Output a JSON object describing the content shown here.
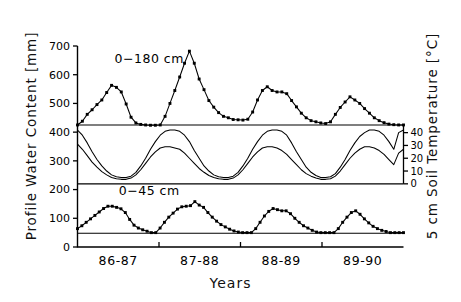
{
  "figure": {
    "xlabel": "Years",
    "ylabel_left": "Profile  Water  Content  [mm]",
    "ylabel_right": "5  cm  Soil  Temperature  [°C]",
    "annotation_top": "0−180  cm",
    "annotation_bottom": "0−45  cm",
    "ink_color": "#000000"
  },
  "chart_data": {
    "type": "line",
    "title": "",
    "subtitle": "",
    "xlabel": "Years",
    "ylabel": "Profile Water Content [mm]",
    "y2label": "5 cm Soil Temperature [°C]",
    "grid": false,
    "legend": "none",
    "annotations": [
      {
        "text": "0−180 cm",
        "x": 0.22,
        "y": 640
      },
      {
        "text": "0−45 cm",
        "x": 0.22,
        "y": 180
      }
    ],
    "x": {
      "categories": [
        "86-87",
        "87-88",
        "88-89",
        "89-90"
      ],
      "tick_positions": [
        0.25,
        0.5,
        0.75
      ],
      "range": [
        0,
        48
      ],
      "unit": "month index over 4 hydrologic years"
    },
    "ylim": [
      0,
      700
    ],
    "yticks": [
      0,
      100,
      200,
      300,
      400,
      500,
      600,
      700
    ],
    "y2lim": [
      0,
      46
    ],
    "y2ticks": [
      0,
      10,
      20,
      30,
      40
    ],
    "reference_lines": [
      {
        "value": 425,
        "axis": "left",
        "label": "0-180 cm baseline"
      },
      {
        "value": 220,
        "axis": "left",
        "label": "temperature panel top"
      },
      {
        "value": 48,
        "axis": "left",
        "label": "0-45 cm baseline"
      }
    ],
    "series": [
      {
        "name": "0-180 cm profile water content",
        "axis": "left",
        "marker": "filled-square",
        "values": [
          425,
          438,
          462,
          478,
          496,
          512,
          538,
          563,
          556,
          540,
          498,
          452,
          432,
          427,
          425,
          424,
          424,
          425,
          455,
          500,
          545,
          592,
          640,
          682,
          640,
          585,
          548,
          510,
          487,
          468,
          455,
          450,
          444,
          443,
          442,
          445,
          470,
          512,
          545,
          558,
          545,
          540,
          540,
          534,
          510,
          488,
          466,
          450,
          440,
          436,
          432,
          430,
          436,
          462,
          486,
          505,
          523,
          512,
          500,
          482,
          466,
          450,
          440,
          433,
          428,
          426,
          425,
          425
        ]
      },
      {
        "name": "5 cm soil temperature (upper trace)",
        "axis": "right",
        "marker": "line",
        "values": [
          42,
          38,
          32,
          25,
          19,
          14,
          10,
          7,
          5.5,
          5,
          5,
          6,
          9,
          14,
          20,
          27,
          33,
          38,
          41,
          42,
          42,
          41,
          38,
          33,
          26,
          20,
          14,
          10,
          7,
          5.5,
          5,
          5,
          6,
          9,
          14,
          20,
          27,
          33,
          38,
          41,
          42,
          42,
          41,
          38,
          32,
          25,
          19,
          13,
          9,
          6.5,
          5,
          5,
          5.5,
          8,
          13,
          19,
          26,
          32,
          37,
          40,
          42,
          42,
          41,
          38,
          33,
          27,
          40,
          42
        ]
      },
      {
        "name": "5 cm soil temperature (lower trace)",
        "axis": "right",
        "marker": "line",
        "values": [
          31,
          27,
          22,
          17,
          13,
          9.5,
          7,
          5,
          4,
          3.5,
          3.5,
          4.5,
          7,
          11,
          16,
          21,
          25,
          28,
          29,
          29,
          28,
          27,
          24,
          20,
          16,
          12,
          9,
          6.5,
          5,
          4,
          3.5,
          3.5,
          4.5,
          7,
          11,
          16,
          21,
          25,
          28,
          29,
          29,
          28,
          26,
          23,
          19,
          15,
          11,
          8,
          6,
          4.5,
          3.5,
          3.5,
          4,
          6,
          10,
          15,
          20,
          24,
          27,
          29,
          29,
          28,
          26,
          23,
          19,
          15,
          24,
          27
        ]
      },
      {
        "name": "0-45 cm profile water content",
        "axis": "left",
        "marker": "filled-square",
        "values": [
          64,
          74,
          86,
          98,
          110,
          122,
          134,
          142,
          142,
          138,
          133,
          120,
          96,
          76,
          66,
          60,
          55,
          50,
          50,
          66,
          86,
          104,
          118,
          132,
          140,
          142,
          144,
          158,
          146,
          138,
          120,
          104,
          90,
          78,
          70,
          62,
          56,
          52,
          50,
          50,
          50,
          64,
          86,
          108,
          124,
          134,
          130,
          126,
          126,
          116,
          100,
          86,
          74,
          66,
          58,
          52,
          50,
          50,
          50,
          50,
          64,
          86,
          104,
          120,
          126,
          114,
          98,
          84,
          72,
          64,
          58,
          54,
          50,
          50,
          50,
          50
        ]
      }
    ]
  }
}
